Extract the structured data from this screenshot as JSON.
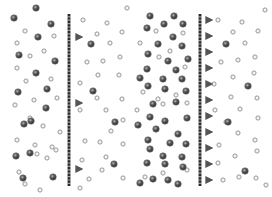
{
  "canvas": {
    "width": 272,
    "height": 197,
    "background": "#ffffff"
  },
  "colors": {
    "membrane_dark": "#2a2a2a",
    "membrane_light": "#9a9a9a",
    "arrow": "#555555",
    "arrow_tail": "#bbbbbb",
    "solute_fill": "#444444",
    "solute_ring": "#888888",
    "solvent_stroke": "#8c8c8c"
  },
  "panels": [
    {
      "id": "left",
      "membrane": {
        "x": 69,
        "y1": 14,
        "y2": 186
      },
      "arrows": [
        {
          "y": 37,
          "x1": 62,
          "x2": 82
        },
        {
          "y": 103,
          "x1": 62,
          "x2": 82
        },
        {
          "y": 169,
          "x1": 62,
          "x2": 82
        }
      ],
      "solute": [
        [
          14,
          18
        ],
        [
          51,
          24
        ],
        [
          38,
          37
        ],
        [
          19,
          55
        ],
        [
          55,
          61
        ],
        [
          36,
          73
        ],
        [
          18,
          92
        ],
        [
          47,
          89
        ],
        [
          36,
          8
        ],
        [
          24,
          124
        ],
        [
          46,
          108
        ],
        [
          31,
          121
        ],
        [
          16,
          156
        ],
        [
          30,
          153
        ],
        [
          53,
          177
        ],
        [
          23,
          178
        ],
        [
          91,
          44
        ],
        [
          93,
          91
        ],
        [
          114,
          164
        ],
        [
          115,
          122
        ]
      ],
      "solvent": [
        [
          25,
          31
        ],
        [
          54,
          36
        ],
        [
          17,
          43
        ],
        [
          44,
          51
        ],
        [
          30,
          56
        ],
        [
          17,
          68
        ],
        [
          26,
          81
        ],
        [
          51,
          79
        ],
        [
          34,
          100
        ],
        [
          15,
          105
        ],
        [
          57,
          98
        ],
        [
          30,
          118
        ],
        [
          43,
          126
        ],
        [
          56,
          150
        ],
        [
          17,
          140
        ],
        [
          35,
          145
        ],
        [
          37,
          154
        ],
        [
          47,
          158
        ],
        [
          19,
          172
        ],
        [
          25,
          184
        ],
        [
          40,
          190
        ],
        [
          60,
          132
        ],
        [
          52,
          147
        ],
        [
          83,
          20
        ],
        [
          107,
          23
        ],
        [
          122,
          32
        ],
        [
          97,
          34
        ],
        [
          110,
          43
        ],
        [
          87,
          62
        ],
        [
          103,
          61
        ],
        [
          120,
          57
        ],
        [
          98,
          75
        ],
        [
          119,
          75
        ],
        [
          80,
          83
        ],
        [
          97,
          98
        ],
        [
          122,
          99
        ],
        [
          80,
          110
        ],
        [
          106,
          110
        ],
        [
          123,
          120
        ],
        [
          111,
          131
        ],
        [
          85,
          141
        ],
        [
          100,
          142
        ],
        [
          123,
          144
        ],
        [
          82,
          160
        ],
        [
          106,
          157
        ],
        [
          89,
          179
        ],
        [
          102,
          170
        ],
        [
          123,
          178
        ],
        [
          127,
          8
        ],
        [
          80,
          188
        ]
      ]
    },
    {
      "id": "right",
      "membrane": {
        "x": 200,
        "y1": 14,
        "y2": 186
      },
      "arrows": [
        {
          "y": 20,
          "x1": 192,
          "x2": 212
        },
        {
          "y": 36,
          "x1": 192,
          "x2": 212
        },
        {
          "y": 52,
          "x1": 192,
          "x2": 212
        },
        {
          "y": 68,
          "x1": 192,
          "x2": 212
        },
        {
          "y": 84,
          "x1": 192,
          "x2": 212
        },
        {
          "y": 100,
          "x1": 192,
          "x2": 212
        },
        {
          "y": 116,
          "x1": 192,
          "x2": 212
        },
        {
          "y": 132,
          "x1": 192,
          "x2": 212
        },
        {
          "y": 148,
          "x1": 192,
          "x2": 212
        },
        {
          "y": 164,
          "x1": 192,
          "x2": 212
        },
        {
          "y": 180,
          "x1": 192,
          "x2": 212
        }
      ],
      "solute": [
        [
          150,
          16
        ],
        [
          174,
          16
        ],
        [
          147,
          28
        ],
        [
          164,
          24
        ],
        [
          183,
          24
        ],
        [
          173,
          37
        ],
        [
          158,
          44
        ],
        [
          182,
          46
        ],
        [
          148,
          54
        ],
        [
          168,
          61
        ],
        [
          188,
          59
        ],
        [
          147,
          69
        ],
        [
          176,
          70
        ],
        [
          140,
          78
        ],
        [
          163,
          79
        ],
        [
          182,
          79
        ],
        [
          148,
          86
        ],
        [
          165,
          89
        ],
        [
          186,
          91
        ],
        [
          153,
          104
        ],
        [
          176,
          102
        ],
        [
          150,
          117
        ],
        [
          165,
          121
        ],
        [
          187,
          118
        ],
        [
          138,
          125
        ],
        [
          156,
          129
        ],
        [
          178,
          134
        ],
        [
          148,
          140
        ],
        [
          170,
          143
        ],
        [
          186,
          144
        ],
        [
          150,
          149
        ],
        [
          163,
          156
        ],
        [
          182,
          157
        ],
        [
          147,
          163
        ],
        [
          165,
          164
        ],
        [
          183,
          167
        ],
        [
          153,
          179
        ],
        [
          168,
          180
        ],
        [
          140,
          183
        ],
        [
          178,
          184
        ],
        [
          226,
          44
        ],
        [
          245,
          171
        ],
        [
          248,
          86
        ],
        [
          228,
          122
        ]
      ],
      "solvent": [
        [
          156,
          31
        ],
        [
          183,
          33
        ],
        [
          140,
          43
        ],
        [
          170,
          51
        ],
        [
          159,
          57
        ],
        [
          185,
          67
        ],
        [
          143,
          92
        ],
        [
          176,
          95
        ],
        [
          163,
          104
        ],
        [
          137,
          110
        ],
        [
          187,
          103
        ],
        [
          158,
          99
        ],
        [
          145,
          177
        ],
        [
          163,
          173
        ],
        [
          187,
          170
        ],
        [
          218,
          20
        ],
        [
          242,
          22
        ],
        [
          233,
          32
        ],
        [
          258,
          31
        ],
        [
          245,
          43
        ],
        [
          221,
          62
        ],
        [
          238,
          60
        ],
        [
          255,
          57
        ],
        [
          233,
          77
        ],
        [
          254,
          73
        ],
        [
          214,
          84
        ],
        [
          231,
          97
        ],
        [
          257,
          98
        ],
        [
          215,
          110
        ],
        [
          240,
          109
        ],
        [
          258,
          118
        ],
        [
          226,
          122
        ],
        [
          238,
          133
        ],
        [
          255,
          140
        ],
        [
          219,
          145
        ],
        [
          235,
          156
        ],
        [
          257,
          151
        ],
        [
          218,
          163
        ],
        [
          239,
          177
        ],
        [
          256,
          178
        ],
        [
          223,
          180
        ],
        [
          265,
          10
        ],
        [
          266,
          185
        ]
      ]
    }
  ]
}
